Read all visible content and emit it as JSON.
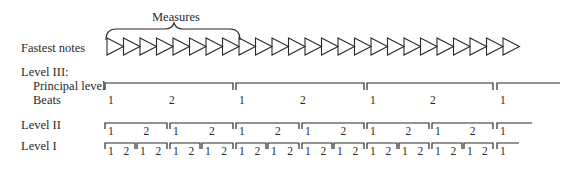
{
  "brace_label": "Measures",
  "labels": {
    "fastest_notes": "Fastest notes",
    "level3": "Level III:",
    "principal_level": "Principal level",
    "beats": "Beats",
    "level2": "Level II",
    "level1": "Level I"
  },
  "triangles": {
    "count": 25,
    "start_x": 107,
    "width": 16.5,
    "top": 38,
    "height": 17,
    "brace_span_count": 8
  },
  "level3_brackets": [
    {
      "x1": 105,
      "x2": 233,
      "beats": [
        "1",
        "2"
      ]
    },
    {
      "x1": 236,
      "x2": 364,
      "beats": [
        "1",
        "2"
      ]
    },
    {
      "x1": 367,
      "x2": 493,
      "beats": [
        "1",
        "2"
      ]
    },
    {
      "x1": 497,
      "x2": 560,
      "beats": [
        "1"
      ],
      "open": true
    }
  ],
  "level2_brackets": [
    {
      "x1": 105,
      "x2": 167,
      "nums": [
        "1",
        "2"
      ]
    },
    {
      "x1": 170,
      "x2": 233,
      "nums": [
        "1",
        "2"
      ]
    },
    {
      "x1": 236,
      "x2": 299,
      "nums": [
        "1",
        "2"
      ]
    },
    {
      "x1": 302,
      "x2": 364,
      "nums": [
        "1",
        "2"
      ]
    },
    {
      "x1": 367,
      "x2": 429,
      "nums": [
        "1",
        "2"
      ]
    },
    {
      "x1": 432,
      "x2": 493,
      "nums": [
        "1",
        "2"
      ]
    },
    {
      "x1": 497,
      "x2": 532,
      "nums": [
        "1"
      ],
      "open": true
    }
  ],
  "level1_brackets": [
    {
      "x1": 105,
      "x2": 135,
      "nums": [
        "1",
        "2"
      ]
    },
    {
      "x1": 137,
      "x2": 167,
      "nums": [
        "1",
        "2"
      ]
    },
    {
      "x1": 170,
      "x2": 200,
      "nums": [
        "1",
        "2"
      ]
    },
    {
      "x1": 202,
      "x2": 233,
      "nums": [
        "1",
        "2"
      ]
    },
    {
      "x1": 236,
      "x2": 266,
      "nums": [
        "1",
        "2"
      ]
    },
    {
      "x1": 268,
      "x2": 299,
      "nums": [
        "1",
        "2"
      ]
    },
    {
      "x1": 302,
      "x2": 332,
      "nums": [
        "1",
        "2"
      ]
    },
    {
      "x1": 334,
      "x2": 364,
      "nums": [
        "1",
        "2"
      ]
    },
    {
      "x1": 367,
      "x2": 397,
      "nums": [
        "1",
        "2"
      ]
    },
    {
      "x1": 399,
      "x2": 429,
      "nums": [
        "1",
        "2"
      ]
    },
    {
      "x1": 432,
      "x2": 462,
      "nums": [
        "1",
        "2"
      ]
    },
    {
      "x1": 464,
      "x2": 493,
      "nums": [
        "1",
        "2"
      ]
    },
    {
      "x1": 497,
      "x2": 519,
      "nums": [
        "1"
      ],
      "open": true
    }
  ],
  "colors": {
    "ink": "#2a2a2a",
    "background": "#ffffff"
  }
}
